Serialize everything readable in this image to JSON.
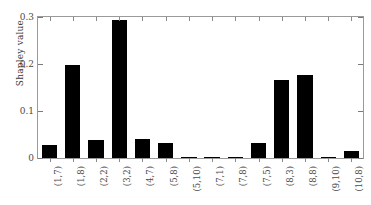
{
  "chart_data": {
    "type": "bar",
    "title": "",
    "subtitle": "",
    "xlabel": "",
    "ylabel": "Shapley value",
    "categories": [
      "(1,7)",
      "(1,8)",
      "(2,2)",
      "(3,2)",
      "(4,7)",
      "(5,8)",
      "(5,10)",
      "(7,1)",
      "(7,8)",
      "(7,5)",
      "(8,3)",
      "(8,8)",
      "(9,10)",
      "(10,8)"
    ],
    "values": [
      0.027,
      0.197,
      0.039,
      0.293,
      0.04,
      0.031,
      0.002,
      0.003,
      0.002,
      0.031,
      0.167,
      0.177,
      0.001,
      0.015
    ],
    "ylim": [
      0,
      0.3
    ],
    "yticks": [
      0,
      0.1,
      0.2,
      0.3
    ],
    "ytick_labels": [
      "0",
      "0.1",
      "0.2",
      "0.3"
    ],
    "grid": false,
    "legend": null,
    "bar_color": "#000000",
    "axis_color": "#9a9a9a",
    "background_color": "#ffffff"
  },
  "figure": {
    "axis_label_color": "#4a4a4a"
  }
}
